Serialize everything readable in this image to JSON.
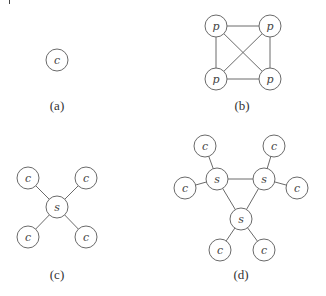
{
  "figure": {
    "panels": [
      {
        "id": "a",
        "label": "(a)",
        "label_pos": [
          57,
          110
        ],
        "nodes": [
          {
            "id": "a1",
            "text": "c",
            "x": 57,
            "y": 60
          }
        ],
        "edges": []
      },
      {
        "id": "b",
        "label": "(b)",
        "label_pos": [
          242,
          110
        ],
        "nodes": [
          {
            "id": "b1",
            "text": "p",
            "x": 216,
            "y": 26
          },
          {
            "id": "b2",
            "text": "p",
            "x": 270,
            "y": 26
          },
          {
            "id": "b3",
            "text": "p",
            "x": 216,
            "y": 79
          },
          {
            "id": "b4",
            "text": "p",
            "x": 270,
            "y": 79
          }
        ],
        "edges": [
          [
            "b1",
            "b2"
          ],
          [
            "b1",
            "b3"
          ],
          [
            "b1",
            "b4"
          ],
          [
            "b2",
            "b3"
          ],
          [
            "b2",
            "b4"
          ],
          [
            "b3",
            "b4"
          ]
        ]
      },
      {
        "id": "c",
        "label": "(c)",
        "label_pos": [
          57,
          279
        ],
        "nodes": [
          {
            "id": "c0",
            "text": "s",
            "x": 57,
            "y": 207
          },
          {
            "id": "c1",
            "text": "c",
            "x": 28,
            "y": 178
          },
          {
            "id": "c2",
            "text": "c",
            "x": 86,
            "y": 178
          },
          {
            "id": "c3",
            "text": "c",
            "x": 28,
            "y": 237
          },
          {
            "id": "c4",
            "text": "c",
            "x": 86,
            "y": 237
          }
        ],
        "edges": [
          [
            "c0",
            "c1"
          ],
          [
            "c0",
            "c2"
          ],
          [
            "c0",
            "c3"
          ],
          [
            "c0",
            "c4"
          ]
        ]
      },
      {
        "id": "d",
        "label": "(d)",
        "label_pos": [
          241,
          279
        ],
        "nodes": [
          {
            "id": "d1",
            "text": "s",
            "x": 217,
            "y": 179
          },
          {
            "id": "d2",
            "text": "s",
            "x": 264,
            "y": 179
          },
          {
            "id": "d3",
            "text": "s",
            "x": 241,
            "y": 219
          },
          {
            "id": "d4",
            "text": "c",
            "x": 205,
            "y": 146
          },
          {
            "id": "d5",
            "text": "c",
            "x": 274,
            "y": 146
          },
          {
            "id": "d6",
            "text": "c",
            "x": 185,
            "y": 188
          },
          {
            "id": "d7",
            "text": "c",
            "x": 297,
            "y": 188
          },
          {
            "id": "d8",
            "text": "c",
            "x": 220,
            "y": 250
          },
          {
            "id": "d9",
            "text": "c",
            "x": 264,
            "y": 250
          }
        ],
        "edges": [
          [
            "d1",
            "d2"
          ],
          [
            "d1",
            "d3"
          ],
          [
            "d2",
            "d3"
          ],
          [
            "d1",
            "d4"
          ],
          [
            "d1",
            "d6"
          ],
          [
            "d2",
            "d5"
          ],
          [
            "d2",
            "d7"
          ],
          [
            "d3",
            "d8"
          ],
          [
            "d3",
            "d9"
          ]
        ]
      }
    ],
    "node_radius": 11,
    "colors": {
      "stroke": "#6a6a6a",
      "text": "#444444",
      "background": "#ffffff"
    }
  }
}
